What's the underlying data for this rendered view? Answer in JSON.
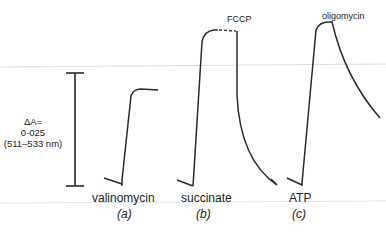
{
  "figure": {
    "scale_bar": {
      "line1": "ΔA=",
      "line2": "0·025",
      "line3": "(511–533 nm)"
    },
    "panels": [
      {
        "id": "a",
        "label": "valinomycin",
        "sublabel": "(a)",
        "annotation": ""
      },
      {
        "id": "b",
        "label": "succinate",
        "sublabel": "(b)",
        "annotation": "FCCP"
      },
      {
        "id": "c",
        "label": "ATP",
        "sublabel": "(c)",
        "annotation": "oligomycin"
      }
    ],
    "colors": {
      "trace": "#2a2a2a",
      "artifact_line": "#d8d8d8"
    }
  }
}
